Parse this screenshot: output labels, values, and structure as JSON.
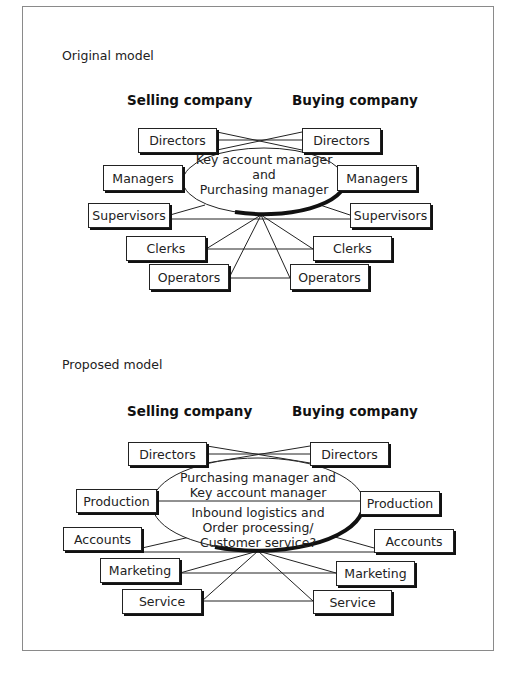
{
  "original": {
    "label": "Original model",
    "selling_heading": "Selling company",
    "buying_heading": "Buying company",
    "center_text": [
      "Key account manager",
      "and",
      "Purchasing manager"
    ],
    "selling_roles": [
      "Directors",
      "Managers",
      "Supervisors",
      "Clerks",
      "Operators"
    ],
    "buying_roles": [
      "Directors",
      "Managers",
      "Supervisors",
      "Clerks",
      "Operators"
    ]
  },
  "proposed": {
    "label": "Proposed model",
    "selling_heading": "Selling company",
    "buying_heading": "Buying company",
    "center_text_upper": [
      "Purchasing manager and",
      "Key account manager"
    ],
    "center_text_lower": [
      "Inbound logistics and",
      "Order processing/",
      "Customer service?"
    ],
    "selling_roles": [
      "Directors",
      "Production",
      "Accounts",
      "Marketing",
      "Service"
    ],
    "buying_roles": [
      "Directors",
      "Production",
      "Accounts",
      "Marketing",
      "Service"
    ]
  }
}
